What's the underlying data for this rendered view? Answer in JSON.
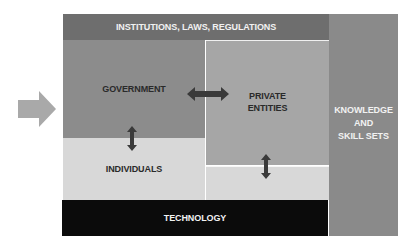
{
  "diagram": {
    "left_arrow": {
      "icon": "right-arrow-icon",
      "color": "#a9a9a9"
    },
    "top_band": {
      "label": "INSTITUTIONS, LAWS, REGULATIONS",
      "color": "#6e6e6e"
    },
    "government": {
      "label": "GOVERNMENT",
      "color": "#8c8c8c"
    },
    "private_entities": {
      "label_line1": "PRIVATE",
      "label_line2": "ENTITIES",
      "color": "#a6a6a6"
    },
    "individuals": {
      "label": "INDIVIDUALS",
      "color": "#d8d8d8"
    },
    "technology": {
      "label": "TECHNOLOGY",
      "color": "#0b0b0b"
    },
    "knowledge": {
      "label_line1": "KNOWLEDGE",
      "label_line2": "AND",
      "label_line3": "SKILL SETS",
      "color": "#8a8a8a"
    },
    "connectors": [
      {
        "from": "government",
        "to": "private_entities",
        "icon": "double-arrow-horizontal-icon"
      },
      {
        "from": "government",
        "to": "individuals",
        "icon": "double-arrow-vertical-icon"
      },
      {
        "from": "private_entities",
        "to": "individuals",
        "icon": "double-arrow-vertical-icon"
      }
    ],
    "arrow_color": "#3a3a3a"
  }
}
